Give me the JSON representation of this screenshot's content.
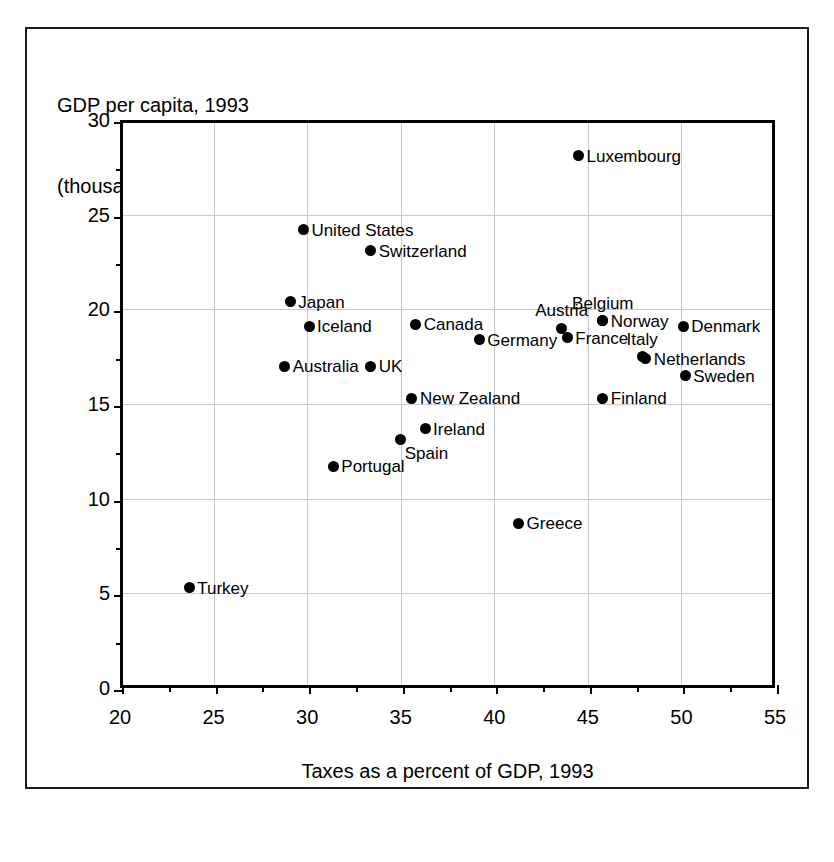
{
  "title": {
    "line1": "GDP per capita, 1993",
    "line2": "(thousands of U.S. dollars)"
  },
  "chart_data": {
    "type": "scatter",
    "title": "GDP per capita, 1993 (thousands of U.S. dollars)",
    "xlabel": "Taxes as a percent of GDP, 1993",
    "ylabel": "GDP per capita, 1993 (thousands of U.S. dollars)",
    "xlim": [
      20,
      55
    ],
    "ylim": [
      0,
      30
    ],
    "xticks": [
      20,
      25,
      30,
      35,
      40,
      45,
      50,
      55
    ],
    "xtick_labels": [
      "20",
      "25",
      "30",
      "35",
      "40",
      "45",
      "50",
      "55"
    ],
    "yticks": [
      0,
      5,
      10,
      15,
      20,
      25,
      30
    ],
    "ytick_labels": [
      "0",
      "5",
      "10",
      "15",
      "20",
      "25",
      "30"
    ],
    "x_minor_ticks": [
      22.5,
      27.5,
      32.5,
      37.5,
      42.5,
      47.5,
      52.5
    ],
    "y_minor_ticks": [
      2.5,
      7.5,
      12.5,
      17.5,
      22.5,
      27.5
    ],
    "grid": true,
    "legend": "none",
    "marker_color": "#000000",
    "grid_color": "#c8c8c8",
    "points": [
      {
        "label": "Luxembourg",
        "x": 44.5,
        "y": 28.1,
        "label_pos": "right"
      },
      {
        "label": "United States",
        "x": 29.8,
        "y": 24.2,
        "label_pos": "right"
      },
      {
        "label": "Switzerland",
        "x": 33.4,
        "y": 23.1,
        "label_pos": "right"
      },
      {
        "label": "Japan",
        "x": 29.1,
        "y": 20.4,
        "label_pos": "right"
      },
      {
        "label": "Iceland",
        "x": 30.1,
        "y": 19.1,
        "label_pos": "right"
      },
      {
        "label": "Canada",
        "x": 35.8,
        "y": 19.2,
        "label_pos": "right"
      },
      {
        "label": "Belgium",
        "x": 45.8,
        "y": 19.4,
        "label_pos": "center-above"
      },
      {
        "label": "Norway",
        "x": 45.8,
        "y": 19.4,
        "label_pos": "right"
      },
      {
        "label": "Denmark",
        "x": 50.1,
        "y": 19.1,
        "label_pos": "right"
      },
      {
        "label": "Austria",
        "x": 43.6,
        "y": 19.0,
        "label_pos": "center-above"
      },
      {
        "label": "France",
        "x": 43.9,
        "y": 18.5,
        "label_pos": "right"
      },
      {
        "label": "Germany",
        "x": 39.2,
        "y": 18.4,
        "label_pos": "right"
      },
      {
        "label": "Italy",
        "x": 47.9,
        "y": 17.5,
        "label_pos": "center-above"
      },
      {
        "label": "Netherlands",
        "x": 48.1,
        "y": 17.4,
        "label_pos": "right"
      },
      {
        "label": "Australia",
        "x": 28.8,
        "y": 17.0,
        "label_pos": "right"
      },
      {
        "label": "UK",
        "x": 33.4,
        "y": 17.0,
        "label_pos": "right"
      },
      {
        "label": "Sweden",
        "x": 50.2,
        "y": 16.5,
        "label_pos": "right"
      },
      {
        "label": "New Zealand",
        "x": 35.6,
        "y": 15.3,
        "label_pos": "right"
      },
      {
        "label": "Finland",
        "x": 45.8,
        "y": 15.3,
        "label_pos": "right"
      },
      {
        "label": "Ireland",
        "x": 36.3,
        "y": 13.7,
        "label_pos": "right"
      },
      {
        "label": "Spain",
        "x": 35.0,
        "y": 13.1,
        "label_pos": "below-right"
      },
      {
        "label": "Portugal",
        "x": 31.4,
        "y": 11.7,
        "label_pos": "right"
      },
      {
        "label": "Greece",
        "x": 41.3,
        "y": 8.7,
        "label_pos": "right"
      },
      {
        "label": "Turkey",
        "x": 23.7,
        "y": 5.3,
        "label_pos": "right"
      }
    ]
  }
}
